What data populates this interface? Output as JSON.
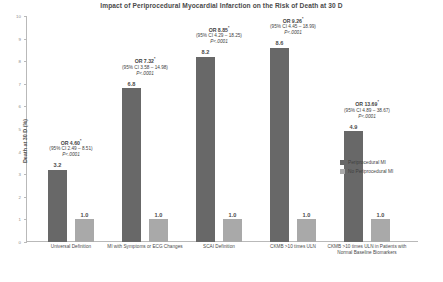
{
  "chart_data": {
    "type": "bar",
    "title": "Impact of Periprocedural Myocardial Infarction on the Risk of Death at 30 D",
    "xlabel": "",
    "ylabel": "Death at 30 D (%)",
    "ylim": [
      0,
      10
    ],
    "yticks": [
      "0",
      "1",
      "2",
      "3",
      "4",
      "5",
      "6",
      "7",
      "8",
      "9",
      "10"
    ],
    "grid": false,
    "legend_position": "right",
    "categories": [
      "Universal Definition",
      "MI with Symptoms or ECG Changes",
      "SCAI Definition",
      "CKMB >10 times ULN",
      "CKMB >10 times ULN in Patients with Normal Baseline Biomarkers"
    ],
    "series": [
      {
        "name": "Periprocedural MI",
        "color": "#686868",
        "values": [
          3.2,
          6.8,
          8.2,
          8.6,
          4.9
        ],
        "value_labels": [
          "3.2",
          "6.8",
          "8.2",
          "8.6",
          "4.9"
        ]
      },
      {
        "name": "No Periprocedural MI",
        "color": "#a9a9a9",
        "values": [
          1.0,
          1.0,
          1.0,
          1.0,
          1.0
        ],
        "value_labels": [
          "1.0",
          "1.0",
          "1.0",
          "1.0",
          "1.0"
        ]
      }
    ],
    "annotations": [
      {
        "or": "OR 4.60",
        "star": "*",
        "ci": "(95% CI 2.49 – 8.51)",
        "p": "P<.0001"
      },
      {
        "or": "OR 7.32",
        "star": "*",
        "ci": "(95% CI 3.58 – 14.98)",
        "p": "P<.0001"
      },
      {
        "or": "OR 8.85",
        "star": "*",
        "ci": "(95% CI 4.29 – 18.25)",
        "p": "P<.0001"
      },
      {
        "or": "OR 9.26",
        "star": "*",
        "ci": "(95% CI 4.45 – 18.99)",
        "p": "P<.0001"
      },
      {
        "or": "OR 13.69",
        "star": "*",
        "ci": "(95% CI 4.89 – 38.67)",
        "p": "P<.0001"
      }
    ]
  },
  "legend": {
    "items": [
      {
        "label": "Periprocedural MI",
        "color": "#686868"
      },
      {
        "label": "No Periprocedural MI",
        "color": "#a9a9a9"
      }
    ]
  }
}
